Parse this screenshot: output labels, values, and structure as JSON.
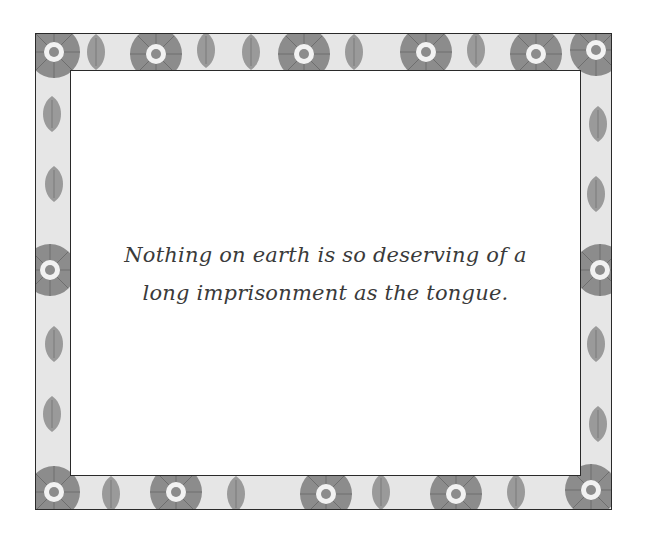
{
  "card": {
    "quote_lines": [
      "Nothing on earth is so deserving of a",
      "long imprisonment as the tongue."
    ],
    "border_style": "floral-pattern",
    "colors": {
      "border_pattern_bg": "#e6e6e6",
      "border_pattern_fg": "#8c8c8c",
      "frame_line": "#2a2a2a",
      "text": "#3a3a3a",
      "background": "#ffffff"
    }
  }
}
